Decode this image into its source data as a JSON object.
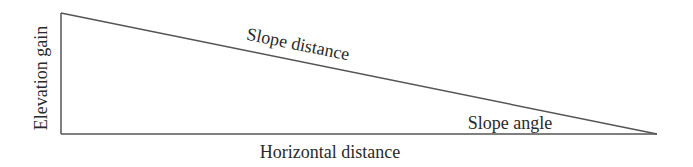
{
  "diagram": {
    "type": "right-triangle",
    "labels": {
      "vertical_side": "Elevation gain",
      "hypotenuse": "Slope distance",
      "angle": "Slope angle",
      "horizontal_side": "Horizontal distance"
    },
    "stroke_color": "#555555",
    "text_color": "#2a2a2a"
  }
}
